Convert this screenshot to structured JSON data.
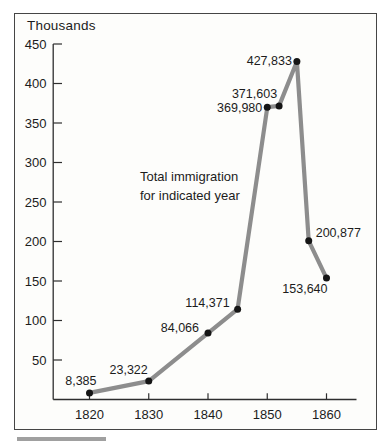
{
  "chart": {
    "unit_label": "Thousands",
    "annotation": {
      "line1": "Total immigration",
      "line2": "for indicated year"
    }
  },
  "chart_data": {
    "type": "line",
    "title": "",
    "annotation": "Total immigration for indicated year",
    "unit": "Thousands",
    "x": [
      1820,
      1830,
      1840,
      1845,
      1850,
      1852,
      1855,
      1857,
      1860
    ],
    "values": [
      8.385,
      23.322,
      84.066,
      114.371,
      369.98,
      371.603,
      427.833,
      200.877,
      153.64
    ],
    "point_labels": [
      "8,385",
      "23,322",
      "84,066",
      "114,371",
      "369,980",
      "371,603",
      "427,833",
      "200,877",
      "153,640"
    ],
    "y_ticks": [
      50,
      100,
      150,
      200,
      250,
      300,
      350,
      400,
      450
    ],
    "x_ticks": [
      1820,
      1830,
      1840,
      1850,
      1860
    ],
    "ylim": [
      0,
      450
    ],
    "xlim": [
      1813.8,
      1865.1
    ],
    "grid": false,
    "legend": "none"
  },
  "colors": {
    "line": "#8d8d8d",
    "point": "#151515",
    "axis": "#2e2e2e",
    "text": "#1c1c1c",
    "frame_border": "#454545",
    "chart_background": "#fdfdfb",
    "footer_bar": "#a0a0a0"
  }
}
